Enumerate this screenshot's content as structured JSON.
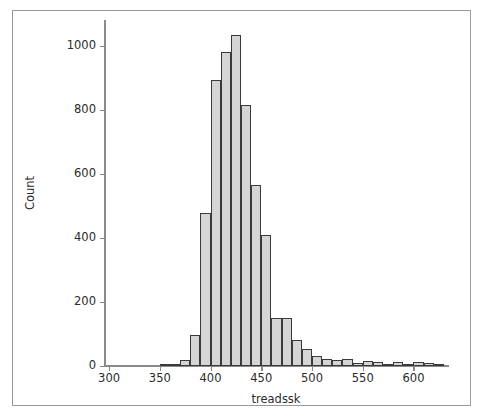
{
  "figure": {
    "background_color": "#ffffff",
    "frame_color": "#9a9a9a",
    "axis_color": "#8a8a8a"
  },
  "axes": {
    "y_title": "Count",
    "x_title": "treadssk"
  },
  "chart_data": {
    "type": "bar",
    "chart_subtype": "histogram",
    "title": "",
    "subtitle": "",
    "xlabel": "treadssk",
    "ylabel": "Count",
    "xlim": [
      295,
      635
    ],
    "ylim": [
      0,
      1080
    ],
    "xticks": [
      300,
      350,
      400,
      450,
      500,
      550,
      600
    ],
    "xtick_labels": [
      "300",
      "350",
      "400",
      "450",
      "500",
      "550",
      "600"
    ],
    "yticks": [
      0,
      200,
      400,
      600,
      800,
      1000
    ],
    "ytick_labels": [
      "0",
      "200",
      "400",
      "600",
      "800",
      "1000"
    ],
    "grid": false,
    "legend": null,
    "legend_position": "none",
    "bin_width": 10,
    "bar_fill_color": "#d5d5d5",
    "bar_edge_color": "#3a3a3a",
    "bin_edges": [
      350,
      360,
      370,
      380,
      390,
      400,
      410,
      420,
      430,
      440,
      450,
      460,
      470,
      480,
      490,
      500,
      510,
      520,
      530,
      540,
      550,
      560,
      570,
      580,
      590,
      600,
      610,
      620,
      630
    ],
    "categories": [
      "350-360",
      "360-370",
      "370-380",
      "380-390",
      "390-400",
      "400-410",
      "410-420",
      "420-430",
      "430-440",
      "440-450",
      "450-460",
      "460-470",
      "470-480",
      "480-490",
      "490-500",
      "500-510",
      "510-520",
      "520-530",
      "530-540",
      "540-550",
      "550-560",
      "560-570",
      "570-580",
      "580-590",
      "590-600",
      "600-610",
      "610-620",
      "620-630"
    ],
    "values": [
      3,
      6,
      20,
      98,
      478,
      893,
      980,
      1032,
      815,
      565,
      408,
      150,
      150,
      82,
      52,
      30,
      22,
      18,
      22,
      8,
      15,
      12,
      5,
      14,
      2,
      12,
      10,
      2
    ]
  }
}
